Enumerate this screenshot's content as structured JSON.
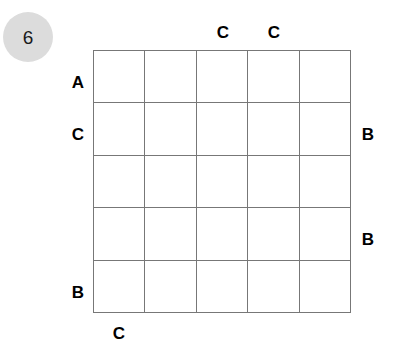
{
  "badge": {
    "number": "6"
  },
  "puzzle": {
    "rows": 5,
    "cols": 5,
    "cell_fill": "#ffffff",
    "line_color": "#777777",
    "badge_color": "#dcdcdc",
    "label_color": "#000000",
    "clues": {
      "top": [
        {
          "label": "",
          "col": 1
        },
        {
          "label": "",
          "col": 2
        },
        {
          "label": "C",
          "col": 3
        },
        {
          "label": "C",
          "col": 4
        },
        {
          "label": "",
          "col": 5
        }
      ],
      "bottom": [
        {
          "label": "C",
          "col": 1
        },
        {
          "label": "",
          "col": 2
        },
        {
          "label": "",
          "col": 3
        },
        {
          "label": "",
          "col": 4
        },
        {
          "label": "",
          "col": 5
        }
      ],
      "left": [
        {
          "label": "A",
          "row": 1
        },
        {
          "label": "C",
          "row": 2
        },
        {
          "label": "",
          "row": 3
        },
        {
          "label": "",
          "row": 4
        },
        {
          "label": "B",
          "row": 5
        }
      ],
      "right": [
        {
          "label": "",
          "row": 1
        },
        {
          "label": "B",
          "row": 2
        },
        {
          "label": "",
          "row": 3
        },
        {
          "label": "B",
          "row": 4
        },
        {
          "label": "",
          "row": 5
        }
      ]
    },
    "cells": [
      [
        "",
        "",
        "",
        "",
        ""
      ],
      [
        "",
        "",
        "",
        "",
        ""
      ],
      [
        "",
        "",
        "",
        "",
        ""
      ],
      [
        "",
        "",
        "",
        "",
        ""
      ],
      [
        "",
        "",
        "",
        "",
        ""
      ]
    ]
  }
}
